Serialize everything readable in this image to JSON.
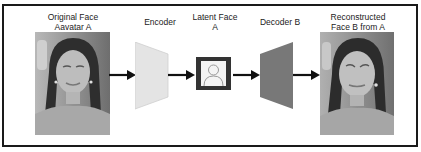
{
  "diagram": {
    "nodes": [
      {
        "id": "original",
        "label_line1": "Original Face",
        "label_line2": "Aavatar A",
        "kind": "photo"
      },
      {
        "id": "encoder",
        "label_line1": "Encoder",
        "kind": "trapezoid",
        "color": "#e4e4e4"
      },
      {
        "id": "latent",
        "label_line1": "Latent Face",
        "label_line2": "A",
        "kind": "icon-box",
        "icon": "person-icon",
        "border_color": "#333333"
      },
      {
        "id": "decoder",
        "label_line1": "Decoder B",
        "kind": "trapezoid",
        "color": "#787878"
      },
      {
        "id": "reconstructed",
        "label_line1": "Reconstructed",
        "label_line2": "Face B from A",
        "kind": "photo"
      }
    ],
    "edges": [
      {
        "from": "original",
        "to": "encoder"
      },
      {
        "from": "encoder",
        "to": "latent"
      },
      {
        "from": "latent",
        "to": "decoder"
      },
      {
        "from": "decoder",
        "to": "reconstructed"
      }
    ],
    "colors": {
      "frame": "#1a1a1a",
      "arrow": "#111111",
      "encoder": "#e4e4e4",
      "decoder": "#787878",
      "latent_border": "#333333"
    }
  }
}
